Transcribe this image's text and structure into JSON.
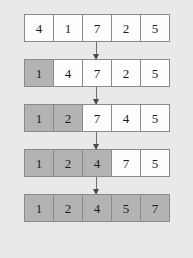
{
  "diagram": {
    "background_color": "#e9e9e9",
    "sorted_cell_color": "#b3b3b3",
    "unsorted_cell_color": "#fdfdfd",
    "border_color": "#8a8a8a",
    "arrow_color": "#4a4a4a",
    "arrow_label": "",
    "rows": [
      {
        "index": 0,
        "cells": [
          {
            "value": "4",
            "sorted": false
          },
          {
            "value": "1",
            "sorted": false
          },
          {
            "value": "7",
            "sorted": false
          },
          {
            "value": "2",
            "sorted": false
          },
          {
            "value": "5",
            "sorted": false
          }
        ]
      },
      {
        "index": 1,
        "cells": [
          {
            "value": "1",
            "sorted": true
          },
          {
            "value": "4",
            "sorted": false
          },
          {
            "value": "7",
            "sorted": false
          },
          {
            "value": "2",
            "sorted": false
          },
          {
            "value": "5",
            "sorted": false
          }
        ]
      },
      {
        "index": 2,
        "cells": [
          {
            "value": "1",
            "sorted": true
          },
          {
            "value": "2",
            "sorted": true
          },
          {
            "value": "7",
            "sorted": false
          },
          {
            "value": "4",
            "sorted": false
          },
          {
            "value": "5",
            "sorted": false
          }
        ]
      },
      {
        "index": 3,
        "cells": [
          {
            "value": "1",
            "sorted": true
          },
          {
            "value": "2",
            "sorted": true
          },
          {
            "value": "4",
            "sorted": true
          },
          {
            "value": "7",
            "sorted": false
          },
          {
            "value": "5",
            "sorted": false
          }
        ]
      },
      {
        "index": 4,
        "cells": [
          {
            "value": "1",
            "sorted": true
          },
          {
            "value": "2",
            "sorted": true
          },
          {
            "value": "4",
            "sorted": true
          },
          {
            "value": "5",
            "sorted": true
          },
          {
            "value": "7",
            "sorted": true
          }
        ]
      }
    ]
  }
}
